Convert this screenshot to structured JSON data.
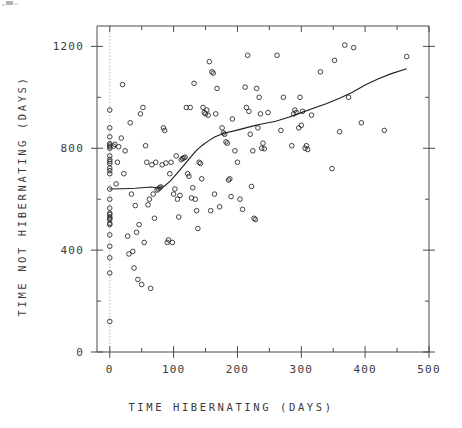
{
  "figure": {
    "kind": "scatterplot-with-smoother",
    "background": "#ffffff",
    "ink_color": "#2e2e2e",
    "axis_color": "#4a4a4a",
    "reference_line_color": "#8d8d8d"
  },
  "chart_data": {
    "type": "scatter",
    "title": "",
    "xlabel": "TIME HIBERNATING (DAYS)",
    "ylabel": "TIME NOT HIBERNATING (DAYS)",
    "xlim": [
      -20,
      500
    ],
    "ylim": [
      0,
      1280
    ],
    "grid": false,
    "legend": null,
    "x_ticks_major": [
      0,
      100,
      200,
      300,
      400,
      500
    ],
    "x_tick_labels": [
      "0",
      "100",
      "200",
      "300",
      "400",
      "500"
    ],
    "x_ticks_minor": [
      50,
      150,
      250,
      350,
      450
    ],
    "y_ticks_major": [
      0,
      400,
      800,
      1200
    ],
    "y_tick_labels": [
      "0",
      "400",
      "800",
      "1200"
    ],
    "y_ticks_minor": [
      200,
      600,
      1000
    ],
    "annotations": [
      {
        "kind": "vertical-reference-line",
        "x": 0,
        "style": "dotted",
        "note": "dotted vertical line at x = 0"
      }
    ],
    "series": [
      {
        "name": "observations",
        "type": "scatter",
        "marker": "open-circle",
        "n": 168,
        "points": [
          [
            0,
            120
          ],
          [
            0,
            310
          ],
          [
            0,
            370
          ],
          [
            0,
            415
          ],
          [
            0,
            460
          ],
          [
            0,
            500
          ],
          [
            0,
            505
          ],
          [
            0,
            520
          ],
          [
            0,
            525
          ],
          [
            0,
            530
          ],
          [
            0,
            540
          ],
          [
            0,
            545
          ],
          [
            0,
            565
          ],
          [
            0,
            600
          ],
          [
            0,
            640
          ],
          [
            0,
            700
          ],
          [
            0,
            712
          ],
          [
            0,
            722
          ],
          [
            0,
            740
          ],
          [
            0,
            748
          ],
          [
            0,
            756
          ],
          [
            0,
            770
          ],
          [
            0,
            800
          ],
          [
            0,
            806
          ],
          [
            0,
            812
          ],
          [
            0,
            818
          ],
          [
            0,
            845
          ],
          [
            0,
            880
          ],
          [
            0,
            950
          ],
          [
            6,
            808
          ],
          [
            8,
            815
          ],
          [
            10,
            660
          ],
          [
            12,
            745
          ],
          [
            14,
            806
          ],
          [
            18,
            840
          ],
          [
            20,
            1050
          ],
          [
            22,
            700
          ],
          [
            24,
            790
          ],
          [
            28,
            455
          ],
          [
            30,
            385
          ],
          [
            32,
            900
          ],
          [
            34,
            620
          ],
          [
            36,
            395
          ],
          [
            38,
            330
          ],
          [
            40,
            575
          ],
          [
            42,
            470
          ],
          [
            44,
            285
          ],
          [
            46,
            500
          ],
          [
            48,
            935
          ],
          [
            50,
            265
          ],
          [
            52,
            960
          ],
          [
            54,
            430
          ],
          [
            56,
            810
          ],
          [
            58,
            745
          ],
          [
            60,
            578
          ],
          [
            62,
            600
          ],
          [
            64,
            250
          ],
          [
            66,
            735
          ],
          [
            68,
            620
          ],
          [
            70,
            525
          ],
          [
            72,
            745
          ],
          [
            74,
            636
          ],
          [
            76,
            640
          ],
          [
            78,
            645
          ],
          [
            80,
            648
          ],
          [
            82,
            735
          ],
          [
            84,
            880
          ],
          [
            86,
            870
          ],
          [
            88,
            742
          ],
          [
            90,
            430
          ],
          [
            92,
            440
          ],
          [
            94,
            700
          ],
          [
            96,
            745
          ],
          [
            98,
            430
          ],
          [
            100,
            620
          ],
          [
            102,
            640
          ],
          [
            104,
            770
          ],
          [
            106,
            600
          ],
          [
            108,
            530
          ],
          [
            110,
            615
          ],
          [
            112,
            755
          ],
          [
            114,
            760
          ],
          [
            116,
            762
          ],
          [
            118,
            765
          ],
          [
            120,
            960
          ],
          [
            122,
            700
          ],
          [
            124,
            690
          ],
          [
            126,
            960
          ],
          [
            128,
            605
          ],
          [
            130,
            645
          ],
          [
            132,
            1055
          ],
          [
            134,
            600
          ],
          [
            136,
            555
          ],
          [
            138,
            485
          ],
          [
            140,
            745
          ],
          [
            142,
            740
          ],
          [
            144,
            680
          ],
          [
            146,
            960
          ],
          [
            148,
            940
          ],
          [
            150,
            935
          ],
          [
            152,
            950
          ],
          [
            154,
            930
          ],
          [
            156,
            1140
          ],
          [
            158,
            555
          ],
          [
            160,
            1100
          ],
          [
            162,
            1095
          ],
          [
            164,
            620
          ],
          [
            166,
            935
          ],
          [
            168,
            1035
          ],
          [
            172,
            570
          ],
          [
            176,
            880
          ],
          [
            178,
            860
          ],
          [
            180,
            855
          ],
          [
            182,
            825
          ],
          [
            184,
            820
          ],
          [
            186,
            675
          ],
          [
            188,
            680
          ],
          [
            190,
            610
          ],
          [
            192,
            915
          ],
          [
            196,
            790
          ],
          [
            200,
            745
          ],
          [
            204,
            600
          ],
          [
            208,
            560
          ],
          [
            212,
            1040
          ],
          [
            214,
            960
          ],
          [
            216,
            1165
          ],
          [
            218,
            945
          ],
          [
            220,
            855
          ],
          [
            222,
            650
          ],
          [
            224,
            790
          ],
          [
            226,
            525
          ],
          [
            228,
            520
          ],
          [
            230,
            1035
          ],
          [
            232,
            880
          ],
          [
            234,
            1000
          ],
          [
            236,
            935
          ],
          [
            238,
            800
          ],
          [
            240,
            820
          ],
          [
            242,
            798
          ],
          [
            248,
            940
          ],
          [
            262,
            1165
          ],
          [
            268,
            870
          ],
          [
            272,
            1000
          ],
          [
            285,
            810
          ],
          [
            288,
            935
          ],
          [
            290,
            950
          ],
          [
            292,
            940
          ],
          [
            296,
            880
          ],
          [
            298,
            1000
          ],
          [
            300,
            890
          ],
          [
            302,
            945
          ],
          [
            306,
            800
          ],
          [
            308,
            810
          ],
          [
            310,
            795
          ],
          [
            316,
            930
          ],
          [
            330,
            1100
          ],
          [
            348,
            720
          ],
          [
            352,
            1145
          ],
          [
            360,
            865
          ],
          [
            368,
            1205
          ],
          [
            374,
            1000
          ],
          [
            382,
            1195
          ],
          [
            394,
            900
          ],
          [
            430,
            870
          ],
          [
            465,
            1160
          ]
        ]
      },
      {
        "name": "lowess-smoother",
        "type": "line",
        "points": [
          [
            0,
            640
          ],
          [
            20,
            641
          ],
          [
            40,
            643
          ],
          [
            55,
            646
          ],
          [
            65,
            648
          ],
          [
            75,
            644
          ],
          [
            85,
            650
          ],
          [
            95,
            672
          ],
          [
            105,
            700
          ],
          [
            115,
            730
          ],
          [
            125,
            760
          ],
          [
            135,
            790
          ],
          [
            145,
            812
          ],
          [
            155,
            830
          ],
          [
            165,
            845
          ],
          [
            180,
            860
          ],
          [
            195,
            868
          ],
          [
            210,
            878
          ],
          [
            225,
            888
          ],
          [
            240,
            896
          ],
          [
            260,
            906
          ],
          [
            280,
            922
          ],
          [
            300,
            940
          ],
          [
            320,
            958
          ],
          [
            340,
            976
          ],
          [
            360,
            996
          ],
          [
            380,
            1020
          ],
          [
            400,
            1048
          ],
          [
            420,
            1072
          ],
          [
            440,
            1092
          ],
          [
            465,
            1112
          ]
        ]
      }
    ]
  },
  "plot_geometry": {
    "left_px": 97,
    "right_px": 429,
    "top_px": 26,
    "bottom_px": 352,
    "x_data_min": -20,
    "x_data_max": 500,
    "y_data_min": 0,
    "y_data_max": 1280
  }
}
